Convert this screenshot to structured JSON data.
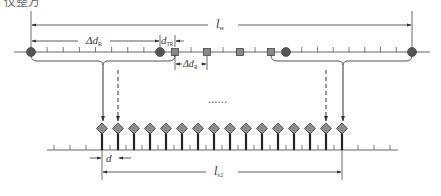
{
  "caption_fragment": "仪整方",
  "labels": {
    "lw": {
      "main": "l",
      "sub": "w"
    },
    "delta_dr_top": {
      "main": "Δd",
      "sub": "R"
    },
    "d_tr": {
      "main": "d",
      "sub": "TR"
    },
    "delta_dr_bottom": {
      "main": "Δd",
      "sub": "R"
    },
    "ellipsis": "......",
    "d": {
      "main": "d",
      "sub": ""
    },
    "lv2": {
      "main": "l",
      "sub": "v2"
    }
  },
  "top_array": {
    "receivers_left": 2,
    "transmitters": 4,
    "receivers_right": 2,
    "minor_ticks_per_gap": 7
  },
  "bottom_array": {
    "virtual_elements": 16
  },
  "colors": {
    "line": "#555555",
    "receiver_fill": "#555555",
    "transmitter_fill": "#8a8a8a",
    "diamond_fill": "#8c8c8c",
    "stem": "#222222"
  }
}
